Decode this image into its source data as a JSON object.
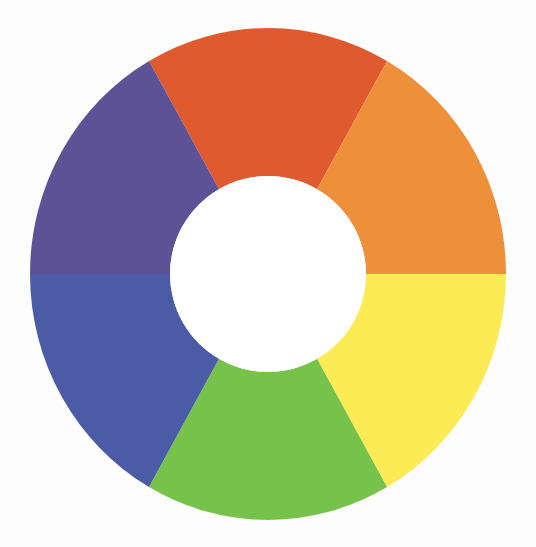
{
  "diagram": {
    "title": "Color wheel",
    "type": "donut-color-wheel",
    "center": {
      "x": 268,
      "y": 274
    },
    "outer_radius": {
      "rx": 238,
      "ry": 246
    },
    "inner_radius": 98,
    "background": "#fdfdfd",
    "hole_color": "#ffffff",
    "segments": [
      {
        "name": "red-orange",
        "color": "#E05A30",
        "start_deg": 240,
        "end_deg": 300
      },
      {
        "name": "orange",
        "color": "#EE8F3A",
        "start_deg": 300,
        "end_deg": 360
      },
      {
        "name": "yellow",
        "color": "#FCEB55",
        "start_deg": 0,
        "end_deg": 60
      },
      {
        "name": "green",
        "color": "#77C24A",
        "start_deg": 60,
        "end_deg": 120
      },
      {
        "name": "blue",
        "color": "#4C5BA6",
        "start_deg": 120,
        "end_deg": 180
      },
      {
        "name": "purple",
        "color": "#5E5296",
        "start_deg": 180,
        "end_deg": 240
      }
    ]
  }
}
